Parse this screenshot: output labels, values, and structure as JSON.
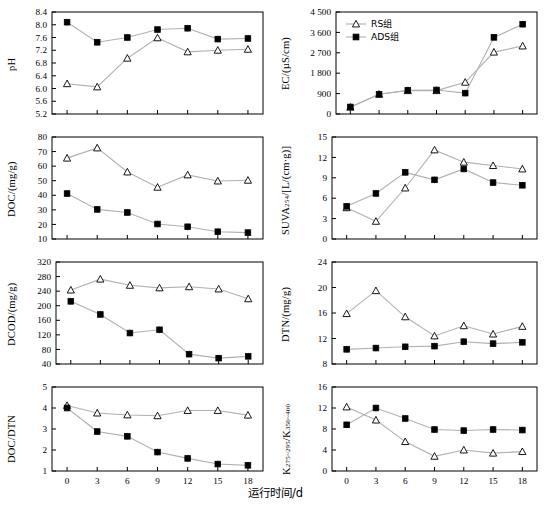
{
  "figure": {
    "xlabel": "运行时间/d",
    "x_ticks": [
      "0",
      "3",
      "6",
      "9",
      "12",
      "15",
      "18"
    ],
    "legend": {
      "series1_label": "RS组",
      "series2_label": "ADS组",
      "series1_marker": "open-triangle",
      "series2_marker": "filled-square"
    },
    "line_color": "#b0b0b0",
    "marker_color": "#000000"
  },
  "chart_data": [
    {
      "type": "line",
      "panel": "pH",
      "title": "",
      "xlabel": "运行时间/d",
      "ylabel": "pH",
      "x": [
        0,
        3,
        6,
        9,
        12,
        15,
        18
      ],
      "xlim": [
        -1.5,
        19.5
      ],
      "ylim": [
        5.2,
        8.4
      ],
      "yticks": [
        "5.2",
        "5.6",
        "6.0",
        "6.4",
        "6.8",
        "7.2",
        "7.6",
        "8.0",
        "8.4"
      ],
      "grid": false,
      "legend_position": "none",
      "series": [
        {
          "name": "RS组",
          "marker": "open-triangle",
          "values": [
            6.15,
            6.05,
            6.95,
            7.59,
            7.15,
            7.2,
            7.23
          ]
        },
        {
          "name": "ADS组",
          "marker": "filled-square",
          "values": [
            8.08,
            7.45,
            7.6,
            7.85,
            7.89,
            7.55,
            7.57
          ]
        }
      ]
    },
    {
      "type": "line",
      "panel": "EC",
      "title": "",
      "xlabel": "运行时间/d",
      "ylabel": "EC/(µS/cm)",
      "x": [
        0,
        3,
        6,
        9,
        12,
        15,
        18
      ],
      "xlim": [
        -1.5,
        19.5
      ],
      "ylim": [
        0,
        4500
      ],
      "yticks": [
        "0",
        "900",
        "1 800",
        "2 700",
        "3 600",
        "4 500"
      ],
      "grid": false,
      "legend_position": "upper-left",
      "series": [
        {
          "name": "RS组",
          "marker": "open-triangle",
          "values": [
            300,
            870,
            1030,
            1030,
            1400,
            2730,
            3000
          ]
        },
        {
          "name": "ADS组",
          "marker": "filled-square",
          "values": [
            310,
            870,
            1050,
            1060,
            920,
            3380,
            3960
          ]
        }
      ]
    },
    {
      "type": "line",
      "panel": "DOC",
      "title": "",
      "xlabel": "运行时间/d",
      "ylabel": "DOC/(mg/g)",
      "x": [
        0,
        3,
        6,
        9,
        12,
        15,
        18
      ],
      "xlim": [
        -1.5,
        19.5
      ],
      "ylim": [
        10,
        80
      ],
      "yticks": [
        "10",
        "20",
        "30",
        "40",
        "50",
        "60",
        "70",
        "80"
      ],
      "grid": false,
      "legend_position": "none",
      "series": [
        {
          "name": "RS组",
          "marker": "open-triangle",
          "values": [
            65.5,
            72.5,
            56.0,
            45.5,
            54.0,
            49.8,
            50.3
          ]
        },
        {
          "name": "ADS组",
          "marker": "filled-square",
          "values": [
            41.2,
            30.3,
            28.2,
            20.3,
            18.4,
            15.0,
            14.4
          ]
        }
      ]
    },
    {
      "type": "line",
      "panel": "SUVA254",
      "title": "",
      "xlabel": "运行时间/d",
      "ylabel": "SUVA254/[L/(cm·g)]",
      "x": [
        0,
        3,
        6,
        9,
        12,
        15,
        18
      ],
      "xlim": [
        -1.5,
        19.5
      ],
      "ylim": [
        0,
        15
      ],
      "yticks": [
        "0",
        "3",
        "6",
        "9",
        "12",
        "15"
      ],
      "grid": false,
      "legend_position": "none",
      "series": [
        {
          "name": "RS组",
          "marker": "open-triangle",
          "values": [
            4.6,
            2.6,
            7.5,
            13.1,
            11.3,
            10.8,
            10.3
          ]
        },
        {
          "name": "ADS组",
          "marker": "filled-square",
          "values": [
            4.8,
            6.7,
            9.8,
            8.7,
            10.3,
            8.3,
            7.9
          ]
        }
      ]
    },
    {
      "type": "line",
      "panel": "DCOD",
      "title": "",
      "xlabel": "运行时间/d",
      "ylabel": "DCOD/(mg/g)",
      "x": [
        0,
        3,
        6,
        9,
        12,
        15,
        18
      ],
      "xlim": [
        -1.5,
        19.5
      ],
      "ylim": [
        40,
        320
      ],
      "yticks": [
        "40",
        "80",
        "120",
        "160",
        "200",
        "240",
        "280",
        "320"
      ],
      "grid": false,
      "legend_position": "none",
      "series": [
        {
          "name": "RS组",
          "marker": "open-triangle",
          "values": [
            243,
            273,
            256,
            249,
            252,
            246,
            219
          ]
        },
        {
          "name": "ADS组",
          "marker": "filled-square",
          "values": [
            212,
            176,
            125,
            134,
            67,
            56,
            61
          ]
        }
      ]
    },
    {
      "type": "line",
      "panel": "DTN",
      "title": "",
      "xlabel": "运行时间/d",
      "ylabel": "DTN/(mg/g)",
      "x": [
        0,
        3,
        6,
        9,
        12,
        15,
        18
      ],
      "xlim": [
        -1.5,
        19.5
      ],
      "ylim": [
        8,
        24
      ],
      "yticks": [
        "8",
        "12",
        "16",
        "20",
        "24"
      ],
      "grid": false,
      "legend_position": "none",
      "series": [
        {
          "name": "RS组",
          "marker": "open-triangle",
          "values": [
            15.9,
            19.5,
            15.4,
            12.4,
            14.0,
            12.7,
            13.9
          ]
        },
        {
          "name": "ADS组",
          "marker": "filled-square",
          "values": [
            10.3,
            10.5,
            10.7,
            10.8,
            11.5,
            11.2,
            11.4
          ]
        }
      ]
    },
    {
      "type": "line",
      "panel": "DOC/DTN",
      "title": "",
      "xlabel": "运行时间/d",
      "ylabel": "DOC/DTN",
      "x": [
        0,
        3,
        6,
        9,
        12,
        15,
        18
      ],
      "xlim": [
        -1.5,
        19.5
      ],
      "ylim": [
        1,
        5
      ],
      "yticks": [
        "1",
        "2",
        "3",
        "4",
        "5"
      ],
      "grid": false,
      "legend_position": "none",
      "series": [
        {
          "name": "RS组",
          "marker": "open-triangle",
          "values": [
            4.12,
            3.76,
            3.67,
            3.63,
            3.88,
            3.88,
            3.66
          ]
        },
        {
          "name": "ADS组",
          "marker": "filled-square",
          "values": [
            4.0,
            2.88,
            2.65,
            1.9,
            1.6,
            1.33,
            1.27
          ]
        }
      ]
    },
    {
      "type": "line",
      "panel": "K275-295/K350-400",
      "title": "",
      "xlabel": "运行时间/d",
      "ylabel": "K275-295/K350-400",
      "x": [
        0,
        3,
        6,
        9,
        12,
        15,
        18
      ],
      "xlim": [
        -1.5,
        19.5
      ],
      "ylim": [
        0,
        16
      ],
      "yticks": [
        "0",
        "4",
        "8",
        "12",
        "16"
      ],
      "grid": false,
      "legend_position": "none",
      "series": [
        {
          "name": "RS组",
          "marker": "open-triangle",
          "values": [
            12.2,
            9.7,
            5.6,
            2.8,
            4.0,
            3.4,
            3.7
          ]
        },
        {
          "name": "ADS组",
          "marker": "filled-square",
          "values": [
            8.8,
            12.0,
            10.0,
            7.9,
            7.7,
            7.9,
            7.8
          ]
        }
      ]
    }
  ]
}
